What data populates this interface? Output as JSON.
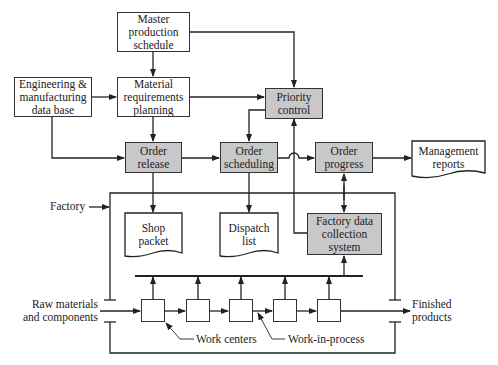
{
  "diagram": {
    "nodes": {
      "master_production_schedule": "Master\nproduction\nschedule",
      "material_requirements_planning": "Material\nrequirements\nplanning",
      "engineering_database": "Engineering &\nmanufacturing\ndata base",
      "priority_control": "Priority\ncontrol",
      "order_release": "Order\nrelease",
      "order_scheduling": "Order\nscheduling",
      "order_progress": "Order\nprogress",
      "management_reports": "Management\nreports",
      "shop_packet": "Shop\npacket",
      "dispatch_list": "Dispatch\nlist",
      "factory_data_collection": "Factory data\ncollection\nsystem"
    },
    "labels": {
      "factory": "Factory",
      "raw_materials": "Raw materials\nand components",
      "finished_products": "Finished\nproducts",
      "work_centers": "Work centers",
      "work_in_process": "Work-in-process"
    },
    "work_center_count": 5,
    "colors": {
      "process_fill": "#c8c8c8",
      "line": "#333333"
    }
  }
}
